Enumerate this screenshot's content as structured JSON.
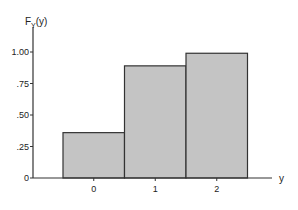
{
  "chart_data": {
    "type": "bar",
    "title": "",
    "ylabel": "F_Y(y)",
    "ylabel_main": "F",
    "ylabel_sub": "Y",
    "ylabel_rest": "(y)",
    "xlabel": "y",
    "categories": [
      "0",
      "1",
      "2"
    ],
    "values": [
      0.36,
      0.89,
      0.99
    ],
    "ylim": [
      0,
      1.1
    ],
    "yticks": [
      0,
      0.25,
      0.5,
      0.75,
      1.0
    ],
    "ytick_labels": [
      "0",
      ".25",
      ".50",
      ".75",
      "1.00"
    ],
    "grid": false,
    "bar_fill": "#c4c4c4",
    "bar_stroke": "#333333"
  }
}
